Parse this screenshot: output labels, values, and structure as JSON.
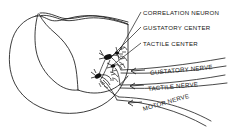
{
  "figure": {
    "ink_color": "#1a1a1a",
    "background_color": "#ffffff"
  },
  "labels": [
    {
      "id": "correlation-neuron",
      "text": "CORRELATION NEURON"
    },
    {
      "id": "gustatory-center",
      "text": "GUSTATORY CENTER"
    },
    {
      "id": "tactile-center",
      "text": "TACTILE CENTER"
    },
    {
      "id": "gustatory-nerve",
      "text": "GUSTATORY NERVE"
    },
    {
      "id": "tactile-nerve",
      "text": "TACTILE NERVE"
    },
    {
      "id": "motor-nerve",
      "text": "MOTOR NERVE"
    }
  ]
}
